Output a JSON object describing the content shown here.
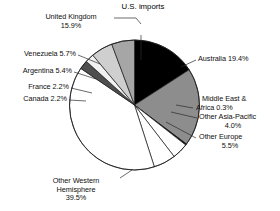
{
  "chart_data": {
    "type": "pie",
    "title": "U.S. imports",
    "xlabel": "",
    "ylabel": "",
    "units": "percent",
    "legend": "none",
    "grid": false,
    "labels_show_percent": true,
    "total": 100.1,
    "start_angle_deg": 0,
    "direction": "clockwise",
    "categories": [
      "United Kingdom",
      "Australia",
      "Middle East & Africa",
      "Other Asia-Pacific",
      "Other Europe",
      "Other Western Hemisphere",
      "Canada",
      "France",
      "Argentina",
      "Venezuela"
    ],
    "values": [
      15.9,
      19.4,
      0.3,
      4.0,
      5.5,
      39.5,
      2.2,
      2.2,
      5.4,
      5.7
    ],
    "slice_colors": [
      "#000000",
      "#8d8d8d",
      "#000000",
      "#ffffff",
      "#ffffff",
      "#ffffff",
      "#4f4f4f",
      "#f2f2f2",
      "#cfcfcf",
      "#a6a6a6"
    ],
    "slices": [
      {
        "name": "United Kingdom",
        "value": 15.9,
        "label": "United Kingdom",
        "value_label": "15.9%",
        "color": "#000000"
      },
      {
        "name": "Australia",
        "value": 19.4,
        "label": "Australia",
        "value_label": "19.4%",
        "color": "#8d8d8d"
      },
      {
        "name": "Middle East & Africa",
        "value": 0.3,
        "label": "Middle East &",
        "value_label": "Africa 0.3%",
        "color": "#000000"
      },
      {
        "name": "Other Asia-Pacific",
        "value": 4.0,
        "label": "Other Asia-Pacific",
        "value_label": "4.0%",
        "color": "#ffffff"
      },
      {
        "name": "Other Europe",
        "value": 5.5,
        "label": "Other Europe",
        "value_label": "5.5%",
        "color": "#ffffff"
      },
      {
        "name": "Other Western Hemisphere",
        "value": 39.5,
        "label": "Other Western Hemisphere",
        "value_label": "39.5%",
        "color": "#ffffff"
      },
      {
        "name": "Canada",
        "value": 2.2,
        "label": "Canada",
        "value_label": "2.2%",
        "color": "#4f4f4f"
      },
      {
        "name": "France",
        "value": 2.2,
        "label": "France",
        "value_label": "2.2%",
        "color": "#f2f2f2"
      },
      {
        "name": "Argentina",
        "value": 5.4,
        "label": "Argentina",
        "value_label": "5.4%",
        "color": "#cfcfcf"
      },
      {
        "name": "Venezuela",
        "value": 5.7,
        "label": "Venezuela",
        "value_label": "5.7%",
        "color": "#a6a6a6"
      }
    ]
  },
  "title": "U.S. imports",
  "annotations": {
    "united_kingdom_line1": "United Kingdom",
    "united_kingdom_line2": "15.9%",
    "venezuela": "Venezuela 5.7%",
    "argentina": "Argentina 5.4%",
    "france": "France 2.2%",
    "canada": "Canada 2.2%",
    "australia": "Australia 19.4%",
    "middle_east_line1": "Middle East &",
    "middle_east_line2": "Africa 0.3%",
    "other_asia_line1": "Other Asia-Pacific",
    "other_asia_line2": "4.0%",
    "other_europe_line1": "Other Europe",
    "other_europe_line2": "5.5%",
    "other_western_line1": "Other Western",
    "other_western_line2": "Hemisphere",
    "other_western_line3": "39.5%"
  }
}
